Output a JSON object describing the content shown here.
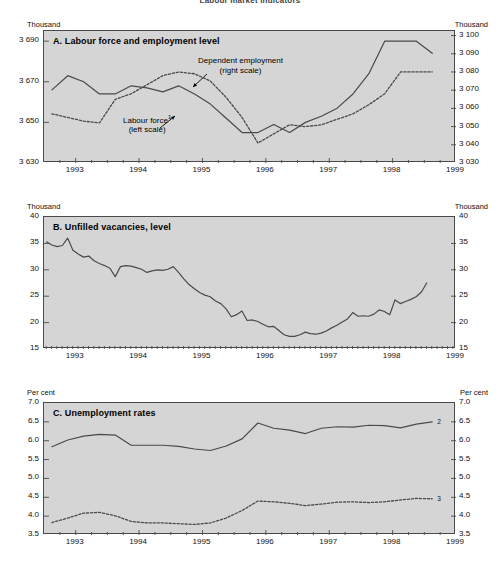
{
  "figure": {
    "title": "Labour market indicators",
    "background_color": "#d5d5d5",
    "line_color": "#4a4a4a",
    "frame_color": "#4a4a4a"
  },
  "panels": [
    {
      "id": "A",
      "title": "A.  Labour force and employment level",
      "unit_left": "Thousand",
      "unit_right": "Thousand",
      "y_left_ticks": [
        "3 630",
        "3 650",
        "3 670",
        "3 690"
      ],
      "y_right_ticks": [
        "3 030",
        "3 040",
        "3 050",
        "3 060",
        "3 070",
        "3 080",
        "3 090",
        "3 100"
      ],
      "x_ticks": [
        "1993",
        "1994",
        "1995",
        "1996",
        "1997",
        "1998",
        "1999"
      ],
      "annotations": [
        {
          "name": "dependent-employment",
          "line1": "Dependent employment",
          "line2": "(right scale)"
        },
        {
          "name": "labour-force",
          "line1": "Labour force",
          "line1_sup": "1",
          "line2": "(left scale)"
        }
      ]
    },
    {
      "id": "B",
      "title": "B.  Unfilled vacancies, level",
      "unit_left": "Thousand",
      "unit_right": "Thousand",
      "y_left_ticks": [
        "15",
        "20",
        "25",
        "30",
        "35",
        "40"
      ],
      "y_right_ticks": [
        "15",
        "20",
        "25",
        "30",
        "35",
        "40"
      ],
      "x_ticks": [
        "1993",
        "1994",
        "1995",
        "1996",
        "1997",
        "1998",
        "1999"
      ]
    },
    {
      "id": "C",
      "title": "C.  Unemployment rates",
      "unit_left": "Per cent",
      "unit_right": "Per cent",
      "y_left_ticks": [
        "3.5",
        "4.0",
        "4.5",
        "5.0",
        "5.5",
        "6.0",
        "6.5",
        "7.0"
      ],
      "y_right_ticks": [
        "3.5",
        "4.0",
        "4.5",
        "5.0",
        "5.5",
        "6.0",
        "6.5",
        "7.0"
      ],
      "x_ticks": [
        "1993",
        "1994",
        "1995",
        "1996",
        "1997",
        "1998",
        "1999"
      ],
      "series_markers": [
        {
          "name": "unemployment-rate-marker",
          "label": "2"
        },
        {
          "name": "standardised-rate-marker",
          "label": "3"
        }
      ]
    }
  ],
  "chart_data": [
    {
      "type": "line",
      "panel": "A",
      "title": "A.  Labour force and employment level",
      "xlabel": "",
      "ylabel": "Thousand",
      "ylabel_right": "Thousand",
      "grid": false,
      "legend": "in-plot annotations",
      "xlim": [
        1992.5,
        1999.0
      ],
      "ylim": [
        3630,
        3695
      ],
      "ylim_right": [
        3030,
        3102.5
      ],
      "x_tick_values": [
        1993,
        1994,
        1995,
        1996,
        1997,
        1998,
        1999
      ],
      "x_minor_interval": 0.25,
      "y_tick_values": [
        3630,
        3650,
        3670,
        3690
      ],
      "y_right_tick_values": [
        3030,
        3040,
        3050,
        3060,
        3070,
        3080,
        3090,
        3100
      ],
      "series": [
        {
          "name": "Labour force (left scale)",
          "style": "solid",
          "axis": "left",
          "x": [
            1992.625,
            1992.875,
            1993.125,
            1993.375,
            1993.625,
            1993.875,
            1994.125,
            1994.375,
            1994.625,
            1994.875,
            1995.125,
            1995.375,
            1995.625,
            1995.875,
            1996.125,
            1996.375,
            1996.625,
            1996.875,
            1997.125,
            1997.375,
            1997.625,
            1997.875,
            1998.125,
            1998.375,
            1998.625
          ],
          "values": [
            3666,
            3673,
            3670,
            3664,
            3664,
            3668,
            3667,
            3665,
            3668,
            3664,
            3659,
            3652,
            3645,
            3645,
            3649,
            3645,
            3650,
            3653,
            3657,
            3664,
            3674,
            3690,
            3690,
            3690,
            3684
          ]
        },
        {
          "name": "Dependent employment (right scale)",
          "style": "dashed",
          "axis": "right",
          "x": [
            1992.625,
            1992.875,
            1993.125,
            1993.375,
            1993.625,
            1993.875,
            1994.125,
            1994.375,
            1994.625,
            1994.875,
            1995.125,
            1995.375,
            1995.625,
            1995.875,
            1996.125,
            1996.375,
            1996.625,
            1996.875,
            1997.125,
            1997.375,
            1997.625,
            1997.875,
            1998.125,
            1998.375,
            1998.625
          ],
          "values": [
            3057,
            3055,
            3053,
            3052,
            3065,
            3068,
            3073,
            3078,
            3080,
            3079,
            3075,
            3066,
            3055,
            3041,
            3046,
            3051,
            3050,
            3051,
            3054,
            3057,
            3062,
            3068,
            3080,
            3080,
            3080
          ]
        }
      ]
    },
    {
      "type": "line",
      "panel": "B",
      "title": "B.  Unfilled vacancies, level",
      "xlabel": "",
      "ylabel": "Thousand",
      "ylabel_right": "Thousand",
      "grid": false,
      "xlim": [
        1992.5,
        1999.0
      ],
      "ylim": [
        15,
        40
      ],
      "x_tick_values": [
        1993,
        1994,
        1995,
        1996,
        1997,
        1998,
        1999
      ],
      "x_minor_interval": 0.0833,
      "y_tick_values": [
        15,
        20,
        25,
        30,
        35,
        40
      ],
      "series": [
        {
          "name": "Unfilled vacancies",
          "style": "solid",
          "frequency": "monthly",
          "x_start": 1992.54,
          "x_step": 0.0833,
          "values": [
            35.3,
            34.7,
            34.4,
            34.6,
            36.0,
            33.7,
            33.0,
            32.4,
            32.6,
            31.7,
            31.2,
            30.8,
            30.3,
            28.7,
            30.6,
            30.8,
            30.7,
            30.4,
            30.1,
            29.5,
            29.8,
            30.0,
            29.9,
            30.1,
            30.6,
            29.5,
            28.3,
            27.2,
            26.4,
            25.7,
            25.2,
            24.9,
            24.1,
            23.6,
            22.6,
            21.1,
            21.5,
            22.2,
            20.4,
            20.5,
            20.2,
            19.7,
            19.2,
            19.3,
            18.5,
            17.7,
            17.4,
            17.4,
            17.7,
            18.2,
            17.9,
            17.8,
            18.0,
            18.4,
            19.0,
            19.5,
            20.1,
            20.7,
            21.9,
            21.2,
            21.3,
            21.2,
            21.6,
            22.4,
            22.1,
            21.5,
            24.3,
            23.6,
            24.0,
            24.4,
            24.9,
            25.8,
            27.5
          ]
        }
      ]
    },
    {
      "type": "line",
      "panel": "C",
      "title": "C.  Unemployment rates",
      "xlabel": "",
      "ylabel": "Per cent",
      "ylabel_right": "Per cent",
      "grid": false,
      "xlim": [
        1992.5,
        1999.0
      ],
      "ylim": [
        3.5,
        7.0
      ],
      "x_tick_values": [
        1993,
        1994,
        1995,
        1996,
        1997,
        1998,
        1999
      ],
      "x_minor_interval": 0.25,
      "y_tick_values": [
        3.5,
        4.0,
        4.5,
        5.0,
        5.5,
        6.0,
        6.5,
        7.0
      ],
      "series": [
        {
          "name": "Unemployment rate",
          "marker_label": "2",
          "style": "solid",
          "x": [
            1992.625,
            1992.875,
            1993.125,
            1993.375,
            1993.625,
            1993.875,
            1994.125,
            1994.375,
            1994.625,
            1994.875,
            1995.125,
            1995.375,
            1995.625,
            1995.875,
            1996.125,
            1996.375,
            1996.625,
            1996.875,
            1997.125,
            1997.375,
            1997.625,
            1997.875,
            1998.125,
            1998.375,
            1998.625
          ],
          "values": [
            5.84,
            6.02,
            6.12,
            6.17,
            6.15,
            5.88,
            5.88,
            5.88,
            5.85,
            5.78,
            5.74,
            5.86,
            6.05,
            6.47,
            6.33,
            6.28,
            6.19,
            6.33,
            6.37,
            6.36,
            6.41,
            6.4,
            6.34,
            6.44,
            6.5,
            6.5,
            6.36
          ]
        },
        {
          "name": "Standardised unemployment rate",
          "marker_label": "3",
          "style": "dashed",
          "x": [
            1992.625,
            1992.875,
            1993.125,
            1993.375,
            1993.625,
            1993.875,
            1994.125,
            1994.375,
            1994.625,
            1994.875,
            1995.125,
            1995.375,
            1995.625,
            1995.875,
            1996.125,
            1996.375,
            1996.625,
            1996.875,
            1997.125,
            1997.375,
            1997.625,
            1997.875,
            1998.125,
            1998.375,
            1998.625
          ],
          "values": [
            3.83,
            3.95,
            4.08,
            4.1,
            4.01,
            3.86,
            3.82,
            3.82,
            3.8,
            3.78,
            3.82,
            3.95,
            4.15,
            4.4,
            4.38,
            4.34,
            4.28,
            4.32,
            4.37,
            4.38,
            4.36,
            4.38,
            4.43,
            4.47,
            4.46,
            4.41
          ]
        }
      ]
    }
  ]
}
